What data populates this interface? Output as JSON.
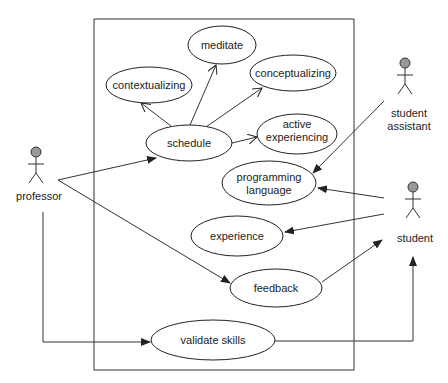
{
  "diagram": {
    "type": "UML use case diagram",
    "system_boundary": {
      "x": 94,
      "y": 19,
      "w": 260,
      "h": 351
    },
    "actors": [
      {
        "id": "professor",
        "label": "professor",
        "x": 36,
        "y": 152
      },
      {
        "id": "student_assistant",
        "label_line1": "student",
        "label_line2": "assistant",
        "x": 406,
        "y": 62
      },
      {
        "id": "student",
        "label": "student",
        "x": 413,
        "y": 187
      }
    ],
    "use_cases": [
      {
        "id": "meditate",
        "label": "meditate",
        "cx": 222,
        "cy": 45,
        "rx": 34,
        "ry": 19
      },
      {
        "id": "contextualizing",
        "label": "contextualizing",
        "cx": 149,
        "cy": 85,
        "rx": 43,
        "ry": 18
      },
      {
        "id": "conceptualizing",
        "label": "conceptualizing",
        "cx": 293,
        "cy": 73,
        "rx": 43,
        "ry": 18
      },
      {
        "id": "schedule",
        "label": "schedule",
        "cx": 189,
        "cy": 143,
        "rx": 43,
        "ry": 18
      },
      {
        "id": "active_experiencing",
        "label_line1": "active",
        "label_line2": "experiencing",
        "cx": 297,
        "cy": 134,
        "rx": 40,
        "ry": 20
      },
      {
        "id": "programming_language",
        "label_line1": "programming",
        "label_line2": "language",
        "cx": 269,
        "cy": 183,
        "rx": 47,
        "ry": 22
      },
      {
        "id": "experience",
        "label": "experience",
        "cx": 237,
        "cy": 236,
        "rx": 46,
        "ry": 20
      },
      {
        "id": "feedback",
        "label": "feedback",
        "cx": 276,
        "cy": 288,
        "rx": 46,
        "ry": 19
      },
      {
        "id": "validate_skills",
        "label": "validate skills",
        "cx": 213,
        "cy": 340,
        "rx": 62,
        "ry": 20
      }
    ],
    "relations": [
      {
        "from": "professor",
        "to": "schedule",
        "arrow": "filled"
      },
      {
        "from": "professor",
        "to": "feedback",
        "arrow": "filled"
      },
      {
        "from": "professor",
        "to": "validate_skills",
        "arrow": "filled",
        "routing": "orthogonal"
      },
      {
        "from": "schedule",
        "to": "contextualizing",
        "arrow": "open"
      },
      {
        "from": "schedule",
        "to": "meditate",
        "arrow": "open"
      },
      {
        "from": "schedule",
        "to": "conceptualizing",
        "arrow": "open"
      },
      {
        "from": "schedule",
        "to": "active_experiencing",
        "arrow": "open"
      },
      {
        "from": "student_assistant",
        "to": "programming_language",
        "arrow": "filled"
      },
      {
        "from": "student",
        "to": "programming_language",
        "arrow": "filled"
      },
      {
        "from": "student",
        "to": "experience",
        "arrow": "filled"
      },
      {
        "from": "feedback",
        "to": "student",
        "arrow": "filled"
      },
      {
        "from": "validate_skills",
        "to": "student",
        "arrow": "filled",
        "routing": "orthogonal"
      }
    ],
    "colors": {
      "actor_head": "#999999",
      "stroke": "#222222",
      "background": "#ffffff"
    }
  }
}
